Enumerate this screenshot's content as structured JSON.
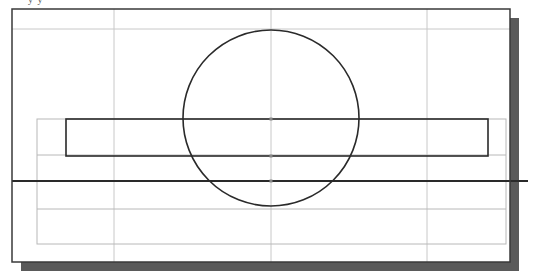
{
  "figure": {
    "caption_fragment": "y   y",
    "colors": {
      "frame": "#3a3a3a",
      "shadow": "#5a5a5a",
      "grid": "#c8c8c8",
      "guide": "#b8b8b8",
      "geometry": "#2a2a2a",
      "background": "#ffffff"
    },
    "frame": {
      "x": 12,
      "y": 9,
      "width": 498,
      "height": 253,
      "shadow_offset": 9
    },
    "grid": {
      "vertical_x": [
        114,
        271,
        427
      ],
      "horizontal_y": [
        29
      ]
    },
    "guide_rectangle": {
      "x": 37,
      "y": 119,
      "width": 469,
      "height": 125,
      "inner_lines_y": [
        155,
        209
      ]
    },
    "rectangle": {
      "x": 66,
      "y": 119,
      "width": 422,
      "height": 37
    },
    "horizontal_line": {
      "y": 181,
      "x1": 12,
      "x2": 528
    },
    "circle": {
      "cx": 271,
      "cy": 118,
      "r": 88
    },
    "markers": [
      {
        "x": 271,
        "y": 119
      },
      {
        "x": 271,
        "y": 156
      },
      {
        "x": 271,
        "y": 181
      }
    ]
  }
}
